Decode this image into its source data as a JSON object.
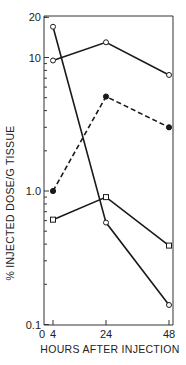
{
  "chart_data": {
    "type": "line",
    "title": "",
    "xlabel": "HOURS AFTER INJECTION",
    "ylabel": "% INJECTED DOSE/G TISSUE",
    "yscale": "log",
    "ylim": [
      0.1,
      20
    ],
    "xlim": [
      0,
      48
    ],
    "x_ticks": [
      0,
      4,
      24,
      48
    ],
    "x_tick_labels": [
      "0",
      "4",
      "24",
      "48"
    ],
    "y_tick_labels": [
      "0.1",
      "1.0",
      "10",
      "20"
    ],
    "y_tick_values": [
      0.1,
      1.0,
      10,
      20
    ],
    "grid": false,
    "legend": null,
    "x": [
      4,
      24,
      48
    ],
    "series": [
      {
        "name": "open circle (steep decline)",
        "marker": "open-circle",
        "line": "solid",
        "values": [
          17,
          0.58,
          0.14
        ]
      },
      {
        "name": "open circle (upper)",
        "marker": "open-circle",
        "line": "solid",
        "values": [
          9.5,
          13,
          7.4
        ]
      },
      {
        "name": "filled circle (dashed)",
        "marker": "filled-circle",
        "line": "dashed",
        "values": [
          1.0,
          5.1,
          3.0
        ]
      },
      {
        "name": "open square",
        "marker": "open-square",
        "line": "solid",
        "values": [
          0.61,
          0.9,
          0.39
        ]
      }
    ]
  },
  "style": {
    "line_color": "#1a1a1a",
    "axis_color": "#333333",
    "background": "#ffffff"
  }
}
